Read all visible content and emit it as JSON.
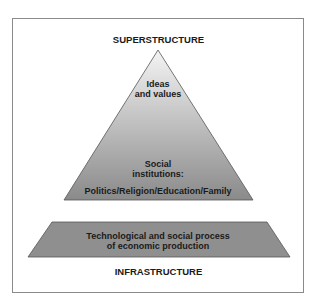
{
  "diagram": {
    "type": "pyramid-on-base",
    "top_label": "SUPERSTRUCTURE",
    "bottom_label": "INFRASTRUCTURE",
    "pyramid": {
      "upper_text_line1": "Ideas",
      "upper_text_line2": "and values",
      "middle_text_line1": "Social",
      "middle_text_line2": "institutions:",
      "lower_text": "Politics/Religion/Education/Family",
      "gradient_top_color": "#f2f2f2",
      "gradient_bottom_color": "#8c8c8c"
    },
    "base": {
      "text_line1": "Technological and social process",
      "text_line2": "of economic production",
      "fill_color": "#8f8f8f"
    },
    "frame_border_color": "#8a8a8a"
  }
}
